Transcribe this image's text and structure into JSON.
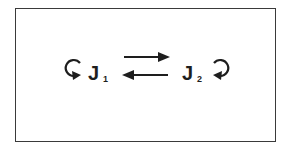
{
  "diagram": {
    "nodes": [
      {
        "id": "J1",
        "label": "J",
        "subscript": "1",
        "self_loop": true
      },
      {
        "id": "J2",
        "label": "J",
        "subscript": "2",
        "self_loop": true
      }
    ],
    "edges": [
      {
        "from": "J1",
        "to": "J2",
        "direction": "right"
      },
      {
        "from": "J2",
        "to": "J1",
        "direction": "left"
      }
    ],
    "colors": {
      "ink": "#1e1e1e",
      "background": "#ffffff",
      "border": "#3a3a3a"
    }
  }
}
